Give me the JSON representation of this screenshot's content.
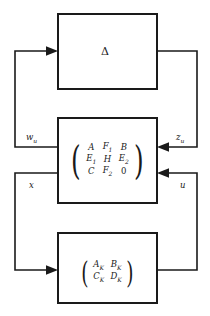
{
  "diagram": {
    "colors": {
      "stroke": "#1a1a1a",
      "background": "#ffffff"
    },
    "blocks": {
      "uncertainty": {
        "name": "uncertainty-block",
        "label": "Δ"
      },
      "plant": {
        "name": "plant-block",
        "rows": [
          [
            "A",
            "F",
            "B"
          ],
          [
            "E",
            "H",
            "E"
          ],
          [
            "C",
            "F",
            "0"
          ]
        ],
        "entries": [
          [
            {
              "base": "A",
              "sub": ""
            },
            {
              "base": "F",
              "sub": "1"
            },
            {
              "base": "B",
              "sub": ""
            }
          ],
          [
            {
              "base": "E",
              "sub": "1"
            },
            {
              "base": "H",
              "sub": ""
            },
            {
              "base": "E",
              "sub": "2"
            }
          ],
          [
            {
              "base": "C",
              "sub": ""
            },
            {
              "base": "F",
              "sub": "2"
            },
            {
              "base": "0",
              "sub": "",
              "numeric": true
            }
          ]
        ]
      },
      "controller": {
        "name": "controller-block",
        "entries": [
          [
            {
              "base": "A",
              "sub": "K"
            },
            {
              "base": "B",
              "sub": "K"
            }
          ],
          [
            {
              "base": "C",
              "sub": "K"
            },
            {
              "base": "D",
              "sub": "K"
            }
          ]
        ]
      }
    },
    "signals": [
      {
        "id": "w_u",
        "base": "w",
        "sub": "u",
        "from": "plant",
        "to": "uncertainty"
      },
      {
        "id": "z_u",
        "base": "z",
        "sub": "u",
        "from": "uncertainty",
        "to": "plant"
      },
      {
        "id": "x",
        "base": "x",
        "sub": "",
        "from": "plant",
        "to": "controller"
      },
      {
        "id": "u",
        "base": "u",
        "sub": "",
        "from": "controller",
        "to": "plant"
      }
    ]
  }
}
